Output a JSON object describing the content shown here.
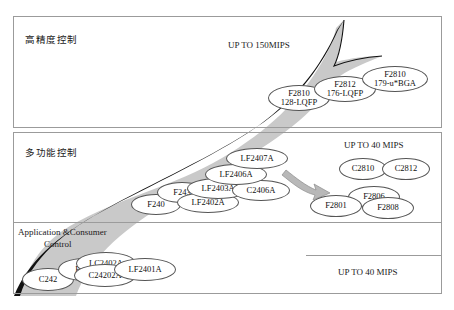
{
  "diagram": {
    "title_sections": {
      "high_precision": "高精度控制",
      "multifunction": "多功能控制",
      "app_consumer_line1": "Application &Consumer",
      "app_consumer_line2": "Control"
    },
    "performance_labels": {
      "top": "UP TO 150MIPS",
      "middle_right": "UP TO 40 MIPS",
      "bottom_right": "UP TO 40 MIPS"
    },
    "colors": {
      "arrow_fill": "#c8c8c8",
      "arrow_outline": "#000000",
      "frame_border": "#9b9b9b",
      "chip_border": "#555555",
      "chip_fill": "#ffffff",
      "text": "#111111"
    },
    "chips": [
      {
        "id": "c242",
        "lines": [
          "C242"
        ],
        "x": 22,
        "y": 268,
        "w": 52,
        "h": 23
      },
      {
        "id": "f241",
        "lines": [
          "F241"
        ],
        "x": 58,
        "y": 258,
        "w": 52,
        "h": 23
      },
      {
        "id": "lc2402a",
        "lines": [
          "LC2402A"
        ],
        "x": 76,
        "y": 252,
        "w": 60,
        "h": 23
      },
      {
        "id": "c24202a",
        "lines": [
          "C24202A"
        ],
        "x": 74,
        "y": 264,
        "w": 62,
        "h": 23
      },
      {
        "id": "lf2401a",
        "lines": [
          "LF2401A"
        ],
        "x": 114,
        "y": 258,
        "w": 62,
        "h": 23
      },
      {
        "id": "f240",
        "lines": [
          "F240"
        ],
        "x": 131,
        "y": 194,
        "w": 50,
        "h": 21
      },
      {
        "id": "f243",
        "lines": [
          "F243"
        ],
        "x": 157,
        "y": 182,
        "w": 50,
        "h": 21
      },
      {
        "id": "lf2402a",
        "lines": [
          "LF2402A"
        ],
        "x": 177,
        "y": 192,
        "w": 62,
        "h": 21
      },
      {
        "id": "lf2403a",
        "lines": [
          "LF2403A"
        ],
        "x": 187,
        "y": 178,
        "w": 62,
        "h": 21
      },
      {
        "id": "c2406a",
        "lines": [
          "C2406A"
        ],
        "x": 232,
        "y": 180,
        "w": 58,
        "h": 21
      },
      {
        "id": "lf2406a",
        "lines": [
          "LF2406A"
        ],
        "x": 205,
        "y": 164,
        "w": 62,
        "h": 21
      },
      {
        "id": "lf2407a",
        "lines": [
          "LF2407A"
        ],
        "x": 226,
        "y": 148,
        "w": 62,
        "h": 21
      },
      {
        "id": "c2810",
        "lines": [
          "C2810"
        ],
        "x": 339,
        "y": 158,
        "w": 48,
        "h": 22
      },
      {
        "id": "c2812",
        "lines": [
          "C2812"
        ],
        "x": 382,
        "y": 158,
        "w": 48,
        "h": 22
      },
      {
        "id": "f2806",
        "lines": [
          "F2806"
        ],
        "x": 348,
        "y": 186,
        "w": 52,
        "h": 22
      },
      {
        "id": "f2801",
        "lines": [
          "F2801"
        ],
        "x": 310,
        "y": 195,
        "w": 52,
        "h": 22
      },
      {
        "id": "f2808",
        "lines": [
          "F2808"
        ],
        "x": 362,
        "y": 197,
        "w": 52,
        "h": 22
      },
      {
        "id": "f2810-128",
        "lines": [
          "F2810",
          "128-LQFP"
        ],
        "x": 268,
        "y": 85,
        "w": 62,
        "h": 26
      },
      {
        "id": "f2812-176",
        "lines": [
          "F2812",
          "176-LQFP"
        ],
        "x": 314,
        "y": 76,
        "w": 62,
        "h": 26
      },
      {
        "id": "f2810-179",
        "lines": [
          "F2810",
          "179-u*BGA"
        ],
        "x": 362,
        "y": 66,
        "w": 66,
        "h": 26
      }
    ]
  }
}
